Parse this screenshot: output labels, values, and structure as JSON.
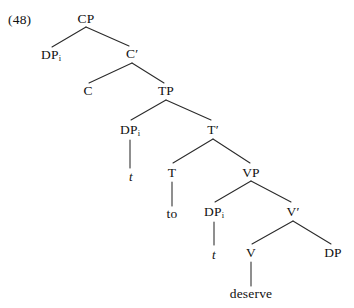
{
  "figure": {
    "example_number": "(48)",
    "type": "syntax-tree"
  },
  "nodes": {
    "example": "(48)",
    "cp": "CP",
    "dp_spec_cp": "DP",
    "dp_spec_cp_index": "i",
    "cbar": "C",
    "cbar_prime": "′",
    "c_head": "C",
    "tp": "TP",
    "dp_spec_tp": "DP",
    "dp_spec_tp_index": "i",
    "trace_spec_tp": "t",
    "tbar": "T",
    "tbar_prime": "′",
    "t_head": "T",
    "t_terminal": "to",
    "vp": "VP",
    "dp_spec_vp": "DP",
    "dp_spec_vp_index": "i",
    "trace_spec_vp": "t",
    "vbar": "V",
    "vbar_prime": "′",
    "v_head": "V",
    "v_terminal": "deserve",
    "dp_object": "DP"
  },
  "style": {
    "line_color": "#2a2a2a",
    "text_color": "#111111",
    "background": "#ffffff"
  }
}
